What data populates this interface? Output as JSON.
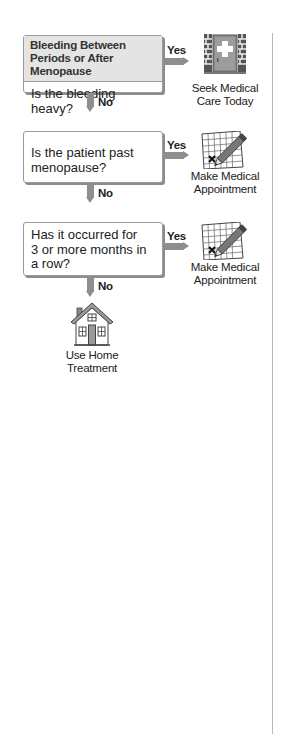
{
  "flowchart": {
    "title": "Bleeding Between Periods or After Menopause",
    "steps": [
      {
        "question": "Is the bleeding heavy?",
        "yes_label": "Yes",
        "no_label": "No",
        "yes_outcome": "Seek Medical Care Today",
        "yes_outcome_lines": [
          "Seek Medical",
          "Care Today"
        ],
        "yes_icon": "hospital-door-icon"
      },
      {
        "question": "Is the patient past menopause?",
        "question_lines": [
          "Is the patient past",
          "menopause?"
        ],
        "yes_label": "Yes",
        "no_label": "No",
        "yes_outcome": "Make Medical Appointment",
        "yes_outcome_lines": [
          "Make Medical",
          "Appointment"
        ],
        "yes_icon": "calendar-pencil-icon"
      },
      {
        "question": "Has it occurred for 3 or more months in a row?",
        "question_lines": [
          "Has it occurred for",
          "3 or more months in",
          "a row?"
        ],
        "yes_label": "Yes",
        "no_label": "No",
        "yes_outcome": "Make Medical Appointment",
        "yes_outcome_lines": [
          "Make Medical",
          "Appointment"
        ],
        "yes_icon": "calendar-pencil-icon"
      }
    ],
    "final_outcome": {
      "label": "Use Home Treatment",
      "lines": [
        "Use Home",
        "Treatment"
      ],
      "icon": "house-icon"
    },
    "colors": {
      "arrow": "#8e8e8e",
      "header_bg": "#e4e4e4",
      "border": "#9a9a9a",
      "divider_line": "#b8b8b8"
    }
  }
}
